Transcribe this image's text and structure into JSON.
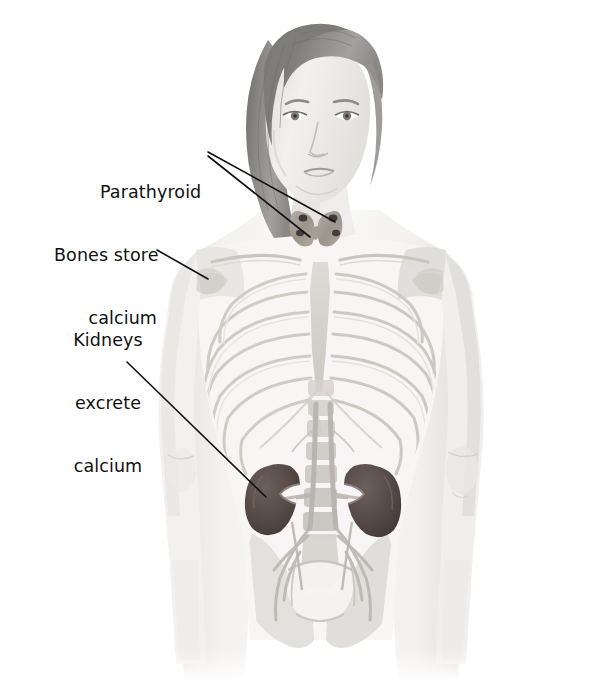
{
  "figure": {
    "background_color": "#ffffff",
    "text_color": "#111111",
    "leader_line_color": "#101010"
  },
  "labels": {
    "parathyroid": {
      "id": "parathyroid",
      "lines": [
        "Parathyroid"
      ],
      "text": "Parathyroid",
      "align": "left",
      "points_to": "parathyroid-glands",
      "leader_count": 2
    },
    "bones": {
      "id": "bones",
      "lines": [
        "Bones store",
        "calcium"
      ],
      "text": "Bones store calcium",
      "align": "right",
      "points_to": "shoulder-bone",
      "leader_count": 1
    },
    "kidneys": {
      "id": "kidneys",
      "lines": [
        "Kidneys",
        "excrete",
        "calcium"
      ],
      "text": "Kidneys excrete calcium",
      "align": "center",
      "points_to": "left-kidney",
      "leader_count": 1
    }
  },
  "anatomy": {
    "parts": [
      {
        "name": "head",
        "label": "Head and face"
      },
      {
        "name": "hair",
        "label": "Hair",
        "color": "#8d8d8d"
      },
      {
        "name": "skin",
        "label": "Skin / body outline",
        "color": "#eceaea"
      },
      {
        "name": "clavicle",
        "label": "Clavicles",
        "color": "#d4d2cd"
      },
      {
        "name": "ribcage",
        "label": "Rib cage",
        "color": "#d8d6d1"
      },
      {
        "name": "sternum",
        "label": "Sternum",
        "color": "#dcdad5"
      },
      {
        "name": "spine",
        "label": "Spine",
        "color": "#d6d4cf"
      },
      {
        "name": "pelvis",
        "label": "Pelvis",
        "color": "#dedcd7"
      },
      {
        "name": "thyroid",
        "label": "Thyroid gland",
        "color": "#a9a49c"
      },
      {
        "name": "parathyroid-glands",
        "label": "Parathyroid glands",
        "color": "#4a4540"
      },
      {
        "name": "kidney-left",
        "label": "Left kidney",
        "color": "#5c4f4c"
      },
      {
        "name": "kidney-right",
        "label": "Right kidney",
        "color": "#5c4f4c"
      },
      {
        "name": "aorta",
        "label": "Aorta and vessels",
        "color": "#bdb9b4"
      },
      {
        "name": "arm-left",
        "label": "Left arm"
      },
      {
        "name": "arm-right",
        "label": "Right arm"
      }
    ]
  }
}
